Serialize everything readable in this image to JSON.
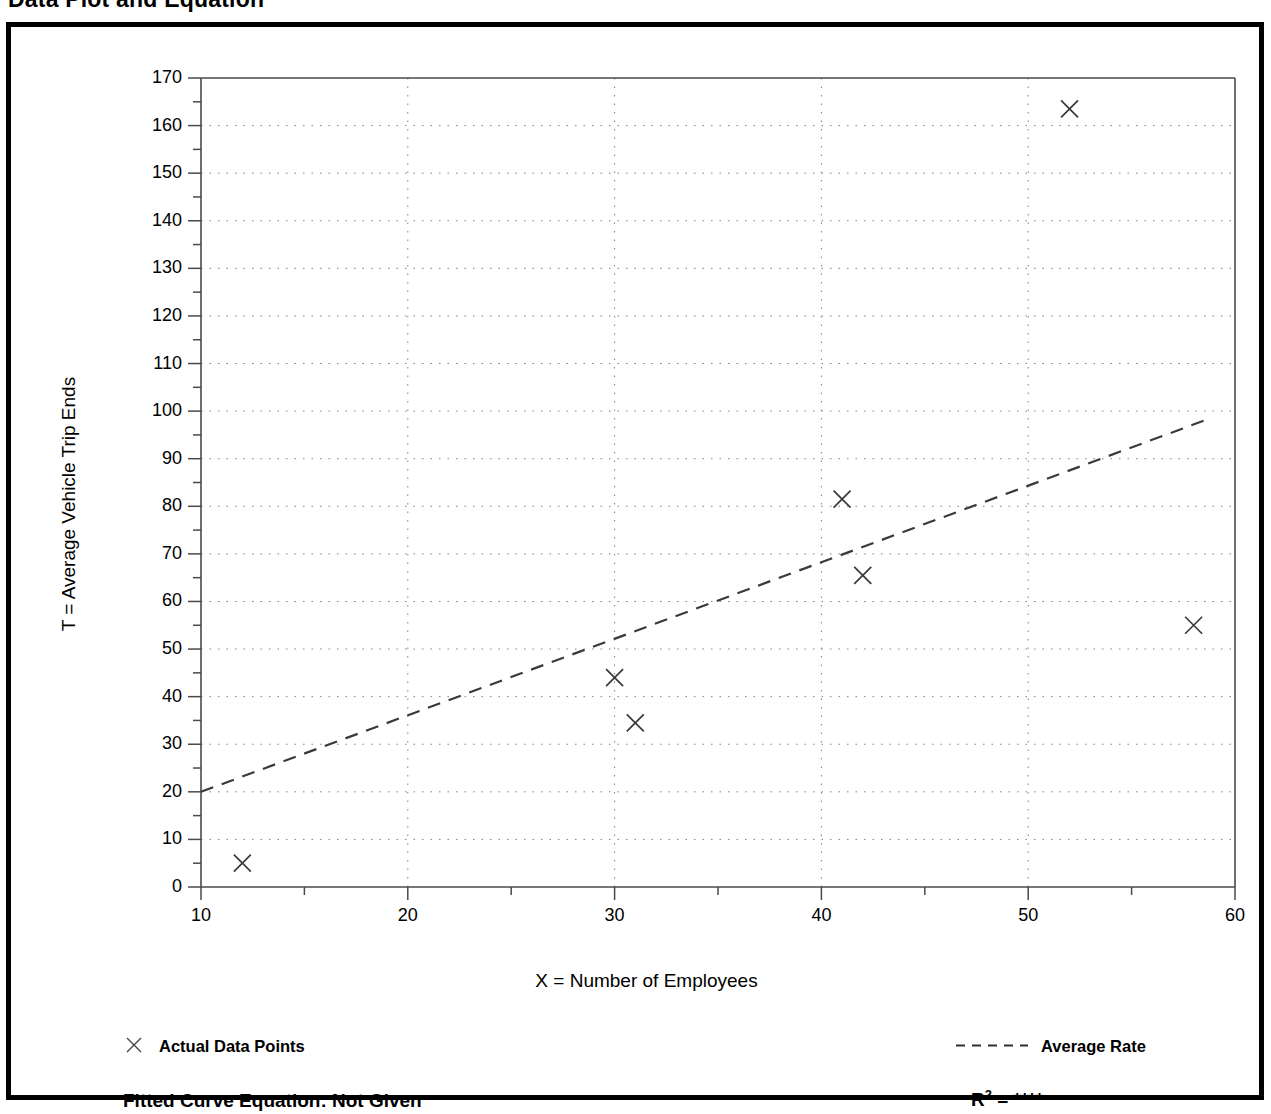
{
  "title": "Data Plot and Equation",
  "axes": {
    "x_title": "X = Number of Employees",
    "y_title": "T = Average Vehicle Trip Ends"
  },
  "legend": {
    "points_label": "Actual Data Points",
    "rate_label": "Average Rate",
    "points_marker": "x-cross-marker",
    "rate_marker": "dashed-line"
  },
  "footer": {
    "equation_label": "Fitted Curve Equation:  Not Given",
    "r2_prefix": "R",
    "r2_exponent": "2",
    "r2_value": " = ****"
  },
  "colors": {
    "ink": "#000000",
    "grid": "#808080",
    "axis": "#555555",
    "panel_border": "#000000",
    "background": "#ffffff"
  },
  "chart_data": {
    "type": "scatter",
    "title": "Data Plot and Equation",
    "xlabel": "X = Number of Employees",
    "ylabel": "T = Average Vehicle Trip Ends",
    "xlim": [
      10,
      60
    ],
    "ylim": [
      0,
      170
    ],
    "xticks": [
      10,
      20,
      30,
      40,
      50,
      60
    ],
    "yticks": [
      0,
      10,
      20,
      30,
      40,
      50,
      60,
      70,
      80,
      90,
      100,
      110,
      120,
      130,
      140,
      150,
      160,
      170
    ],
    "x_minor_tick_step": 5,
    "y_minor_tick_step": 5,
    "grid": true,
    "grid_style": "dotted",
    "legend_position": "below-plot",
    "series": [
      {
        "name": "Actual Data Points",
        "type": "scatter",
        "marker": "x",
        "points": [
          {
            "x": 12,
            "y": 5
          },
          {
            "x": 30,
            "y": 44
          },
          {
            "x": 31,
            "y": 34.5
          },
          {
            "x": 41,
            "y": 81.5
          },
          {
            "x": 42,
            "y": 65.5
          },
          {
            "x": 52,
            "y": 163.5
          },
          {
            "x": 58,
            "y": 55
          }
        ]
      },
      {
        "name": "Average Rate",
        "type": "line",
        "linestyle": "dashed",
        "points": [
          {
            "x": 10,
            "y": 20
          },
          {
            "x": 58.5,
            "y": 98
          }
        ]
      }
    ],
    "annotations": [
      "Fitted Curve Equation:  Not Given",
      "R2 = ****"
    ]
  }
}
